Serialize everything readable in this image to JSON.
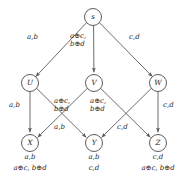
{
  "figure": {
    "type": "directed-graph-diagram",
    "background_color": "#ffffff",
    "stroke_color": "#5a5a5a",
    "text_color": "#2b2b2b"
  },
  "nodes": [
    {
      "id": "s",
      "label": "s",
      "x": 93,
      "y": 17,
      "r": 8.5
    },
    {
      "id": "U",
      "label": "U",
      "x": 30,
      "y": 83,
      "r": 8.5
    },
    {
      "id": "V",
      "label": "V",
      "x": 94,
      "y": 83,
      "r": 8.5
    },
    {
      "id": "W",
      "label": "W",
      "x": 158,
      "y": 83,
      "r": 8.5
    },
    {
      "id": "X",
      "label": "X",
      "x": 30,
      "y": 143,
      "r": 8.5
    },
    {
      "id": "Y",
      "label": "Y",
      "x": 94,
      "y": 143,
      "r": 8.5
    },
    {
      "id": "Z",
      "label": "Z",
      "x": 158,
      "y": 143,
      "r": 8.5
    }
  ],
  "edges": [
    {
      "id": "s-U",
      "from": "s",
      "to": "U"
    },
    {
      "id": "s-V",
      "from": "s",
      "to": "V"
    },
    {
      "id": "s-W",
      "from": "s",
      "to": "W"
    },
    {
      "id": "U-X",
      "from": "U",
      "to": "X"
    },
    {
      "id": "U-Y",
      "from": "U",
      "to": "Y"
    },
    {
      "id": "V-X",
      "from": "V",
      "to": "X"
    },
    {
      "id": "V-Z",
      "from": "V",
      "to": "Z"
    },
    {
      "id": "W-Y",
      "from": "W",
      "to": "Y"
    },
    {
      "id": "W-Z",
      "from": "W",
      "to": "Z"
    }
  ],
  "edge_labels": {
    "s_U": {
      "line1": "a,b",
      "line2": "",
      "x": 33,
      "y": 38
    },
    "s_V": {
      "line1": "a⊕c,",
      "line2": "b⊕d",
      "x": 74,
      "y": 37
    },
    "s_W": {
      "line1": "c,d",
      "line2": "",
      "x": 134,
      "y": 38
    },
    "U_X": {
      "line1": "a,b",
      "line2": "",
      "x": 8,
      "y": 105
    },
    "V_X": {
      "line1": "a⊕c,",
      "line2": "b⊕d",
      "x": 58,
      "y": 100
    },
    "W_Y": {
      "line1": "a⊕c,",
      "line2": "b⊕d",
      "x": 94,
      "y": 100
    },
    "U_Y": {
      "line1": "a,b",
      "line2": "",
      "x": 57,
      "y": 126
    },
    "V_Z": {
      "line1": "c,d",
      "line2": "",
      "x": 120,
      "y": 126
    },
    "W_Z": {
      "line1": "c,d",
      "line2": "",
      "x": 163,
      "y": 105
    }
  },
  "node_annotations": {
    "X": {
      "line1": "a,b",
      "line2": "a⊕c, b⊕d",
      "cx": 30,
      "y": 156
    },
    "Y": {
      "line1": "a,b",
      "line2": "c,d",
      "cx": 94,
      "y": 156
    },
    "Z": {
      "line1": "c,d",
      "line2": "a⊕c, b⊕d",
      "cx": 158,
      "y": 156
    }
  }
}
